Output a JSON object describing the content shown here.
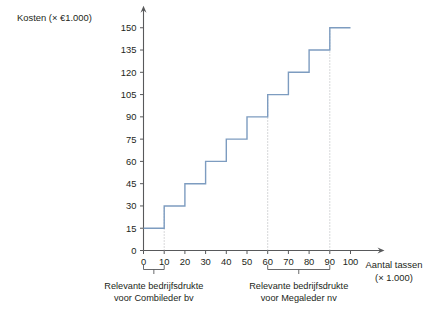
{
  "chart_data": {
    "type": "line",
    "subtype": "step",
    "title": "",
    "ylabel": "Kosten (× €1.000)",
    "xlabel": "Aantal tassen",
    "xlabel_unit": "(× 1.000)",
    "x_ticks": [
      0,
      10,
      20,
      30,
      40,
      50,
      60,
      70,
      80,
      90,
      100
    ],
    "y_ticks": [
      0,
      15,
      30,
      45,
      60,
      75,
      90,
      105,
      120,
      135,
      150
    ],
    "xlim": [
      0,
      100
    ],
    "ylim": [
      0,
      150
    ],
    "grid": false,
    "legend": "none",
    "series": [
      {
        "name": "Kosten",
        "steps": [
          {
            "x_start": 0,
            "x_end": 10,
            "y": 15
          },
          {
            "x_start": 10,
            "x_end": 20,
            "y": 30
          },
          {
            "x_start": 20,
            "x_end": 30,
            "y": 45
          },
          {
            "x_start": 30,
            "x_end": 40,
            "y": 60
          },
          {
            "x_start": 40,
            "x_end": 50,
            "y": 75
          },
          {
            "x_start": 50,
            "x_end": 60,
            "y": 90
          },
          {
            "x_start": 60,
            "x_end": 70,
            "y": 105
          },
          {
            "x_start": 70,
            "x_end": 80,
            "y": 120
          },
          {
            "x_start": 80,
            "x_end": 90,
            "y": 135
          },
          {
            "x_start": 90,
            "x_end": 100,
            "y": 150
          }
        ],
        "color": "#7d9cc0"
      }
    ],
    "guides": [
      {
        "x": 10,
        "y_top": 30,
        "style": "dotted"
      },
      {
        "x": 60,
        "y_top": 105,
        "style": "dotted"
      },
      {
        "x": 90,
        "y_top": 150,
        "style": "dotted"
      }
    ],
    "annotations": [
      {
        "id": "combileder",
        "x_start": 0,
        "x_end": 10,
        "line1": "Relevante bedrijfsdrukte",
        "line2": "voor Combileder bv"
      },
      {
        "id": "megaleder",
        "x_start": 60,
        "x_end": 90,
        "line1": "Relevante bedrijfsdrukte",
        "line2": "voor Megaleder nv"
      }
    ],
    "colors": {
      "line": "#7d9cc0",
      "axis": "#58595b",
      "guide": "#a7a9ac",
      "text": "#231f20",
      "background": "#ffffff"
    }
  }
}
